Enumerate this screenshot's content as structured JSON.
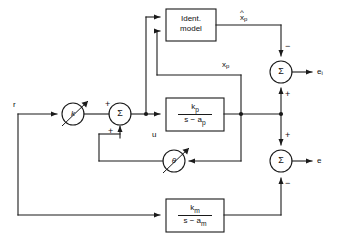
{
  "diagram": {
    "signals": {
      "reference_input": "r",
      "control_input": "u",
      "plant_state": "x",
      "plant_state_sub": "p",
      "estimated_state": "x",
      "estimated_state_sub": "p",
      "estimated_state_accent": "^",
      "identification_error": "e",
      "identification_error_sub": "i",
      "tracking_error": "e"
    },
    "blocks": [
      {
        "id": "ident-model",
        "name": "identification-model-block",
        "shape": "rect",
        "line1": "Ident.",
        "line2": "model"
      },
      {
        "id": "plant",
        "name": "plant-transfer-function-block",
        "shape": "rect",
        "numerator": "k",
        "numerator_sub": "p",
        "denominator": "s − a",
        "denominator_sub": "p"
      },
      {
        "id": "reference-model",
        "name": "reference-model-transfer-function-block",
        "shape": "rect",
        "numerator": "k",
        "numerator_sub": "m",
        "denominator": "s − a",
        "denominator_sub": "m"
      },
      {
        "id": "gain-k",
        "name": "adjustable-gain-k",
        "shape": "circle",
        "label": "k",
        "adjustable": true
      },
      {
        "id": "gain-theta",
        "name": "adjustable-gain-theta",
        "shape": "circle",
        "label": "θ",
        "adjustable": true
      },
      {
        "id": "sum-input",
        "name": "input-summing-junction",
        "shape": "circle",
        "label": "Σ",
        "signs": [
          "+",
          "+"
        ]
      },
      {
        "id": "sum-ident-error",
        "name": "identification-error-summing-junction",
        "shape": "circle",
        "label": "Σ",
        "signs": [
          "−",
          "+"
        ]
      },
      {
        "id": "sum-tracking-error",
        "name": "tracking-error-summing-junction",
        "shape": "circle",
        "label": "Σ",
        "signs": [
          "+",
          "−"
        ]
      }
    ],
    "signs": {
      "input_sum_top": "+",
      "input_sum_bottom": "+",
      "ident_sum_top": "−",
      "ident_sum_bottom": "+",
      "track_sum_top": "+",
      "track_sum_bottom": "−"
    },
    "colors": {
      "line": "#1a1a1a",
      "background": "#ffffff",
      "text": "#111111"
    }
  }
}
